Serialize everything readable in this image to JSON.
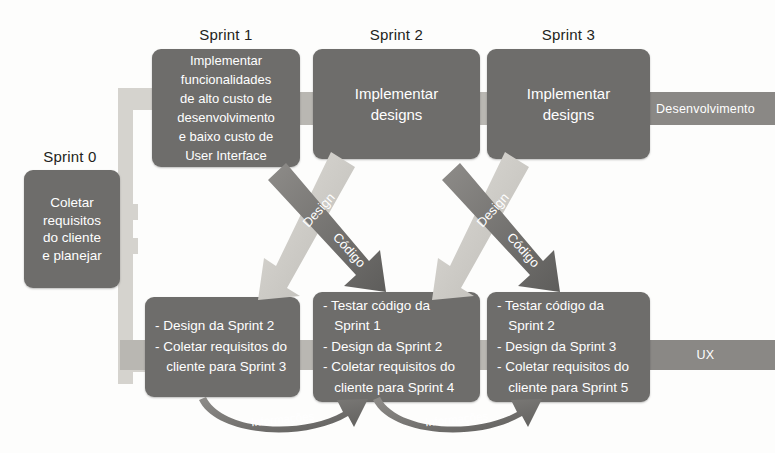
{
  "diagram": {
    "colors": {
      "box_fill": "#6e6d6b",
      "band_light": "#d5d3ce",
      "band_mid": "#b9b7b2",
      "lane_bar": "#8a8885",
      "arrow_light": "#c9c7c2",
      "arrow_dark": "#6f6e6c",
      "text_on_box": "#ffffff",
      "caption_text": "#231f20",
      "background": "#fdfdfc"
    }
  },
  "captions": [
    {
      "label": "Sprint 0"
    },
    {
      "label": "Sprint 1"
    },
    {
      "label": "Sprint 2"
    },
    {
      "label": "Sprint 3"
    }
  ],
  "sprint0": {
    "caption": "Sprint 0",
    "lines": [
      "Coletar",
      "requisitos",
      "do cliente",
      "e planejar"
    ]
  },
  "top_row": [
    {
      "caption": "Sprint 1",
      "lines": [
        "Implementar",
        "funcionalidades",
        "de alto custo de",
        "desenvolvimento",
        "e baixo custo de",
        "User Interface"
      ]
    },
    {
      "caption": "Sprint 2",
      "lines": [
        "Implementar",
        "designs"
      ]
    },
    {
      "caption": "Sprint 3",
      "lines": [
        "Implementar",
        "designs"
      ]
    }
  ],
  "bottom_row": [
    {
      "lines": [
        "- Design da Sprint 2",
        "- Coletar requisitos do",
        "   cliente para Sprint 3"
      ]
    },
    {
      "lines": [
        "- Testar código da",
        "   Sprint 1",
        "- Design da Sprint 2",
        "- Coletar requisitos do",
        "   cliente para Sprint 4"
      ]
    },
    {
      "lines": [
        "- Testar código da",
        "   Sprint 2",
        "- Design da Sprint 3",
        "- Coletar requisitos do",
        "   cliente para Sprint 5"
      ]
    }
  ],
  "lanes": {
    "development": "Desenvolvimento",
    "ux": "UX"
  },
  "arrows": {
    "design_1": "Design",
    "codigo_1": "Código",
    "design_2": "Design",
    "codigo_2": "Código",
    "informacoes_1": "Informações",
    "informacoes_2": "Informações"
  }
}
